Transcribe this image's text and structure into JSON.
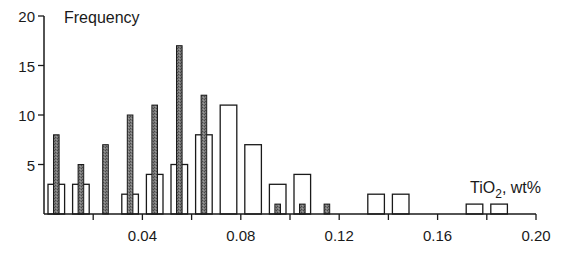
{
  "chart_data": {
    "type": "bar",
    "title": "",
    "ylabel": "Frequency",
    "xlabel": "TiO2, wt%",
    "xlabel_main": "TiO",
    "xlabel_sub": "2",
    "xlabel_rest": ", wt%",
    "xlim": [
      0.0,
      0.2
    ],
    "ylim": [
      0,
      20
    ],
    "x_ticks_major": [
      0.04,
      0.08,
      0.12,
      0.16,
      0.2
    ],
    "x_tick_labels": [
      "0.04",
      "0.08",
      "0.12",
      "0.16",
      "0.20"
    ],
    "x_ticks_minor": [
      0.02,
      0.06,
      0.1,
      0.14,
      0.18
    ],
    "y_ticks": [
      5,
      10,
      15,
      20
    ],
    "y_tick_labels": [
      "5",
      "10",
      "15",
      "20"
    ],
    "bin_width": 0.01,
    "grid": false,
    "legend": null,
    "series": [
      {
        "name": "open bars",
        "style": "outline",
        "color": "#ffffff",
        "stroke": "#1a1a1a",
        "bins": [
          0.005,
          0.015,
          0.035,
          0.045,
          0.055,
          0.065,
          0.075,
          0.085,
          0.095,
          0.105,
          0.135,
          0.145,
          0.175,
          0.185
        ],
        "values": [
          3,
          3,
          2,
          4,
          5,
          8,
          11,
          7,
          3,
          4,
          2,
          2,
          1,
          1
        ]
      },
      {
        "name": "shaded bars",
        "style": "filled",
        "color": "#6e6e6e",
        "stroke": "#1a1a1a",
        "bins": [
          0.005,
          0.015,
          0.025,
          0.035,
          0.045,
          0.055,
          0.065,
          0.095,
          0.105,
          0.115
        ],
        "values": [
          8,
          5,
          7,
          10,
          11,
          17,
          12,
          1,
          1,
          1
        ]
      }
    ]
  }
}
